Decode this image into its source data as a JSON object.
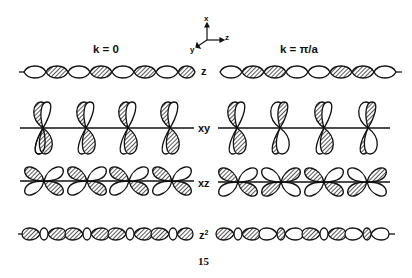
{
  "figure": {
    "number": "15",
    "axes": {
      "up": "x",
      "right": "z",
      "diag": "y"
    },
    "columns": [
      {
        "label": "k = 0"
      },
      {
        "label": "k = π/a"
      }
    ],
    "rows": [
      {
        "label": "z",
        "orbital": "p_z",
        "k0_phases": [
          "+",
          "+",
          "+",
          "+"
        ],
        "kpi_phases": [
          "-",
          "+",
          "-",
          "+"
        ]
      },
      {
        "label": "xy",
        "orbital": "d_xy",
        "k0_phases": [
          "+",
          "+",
          "+",
          "+"
        ],
        "kpi_phases": [
          "+",
          "-",
          "+",
          "-"
        ]
      },
      {
        "label": "xz",
        "orbital": "d_xz",
        "k0_phases": [
          "+",
          "+",
          "+",
          "+"
        ],
        "kpi_phases": [
          "+",
          "-",
          "+",
          "-"
        ]
      },
      {
        "label": "z²",
        "label_base": "z",
        "label_sup": "2",
        "orbital": "d_z2",
        "k0_phases": [
          "+",
          "+",
          "+",
          "+"
        ],
        "kpi_phases": [
          "+",
          "-",
          "+",
          "-"
        ]
      }
    ],
    "colors": {
      "ink": "#111111",
      "background": "#ffffff"
    }
  }
}
